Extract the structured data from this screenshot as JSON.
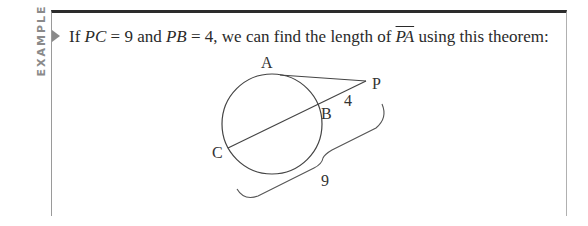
{
  "side_label": "EXAMPLE",
  "sentence": {
    "part1": "If ",
    "pc": "PC",
    "part2": " = 9 and ",
    "pb": "PB",
    "part3": " = 4, we can find the length of ",
    "pa": "PA",
    "part4": " using this theorem:"
  },
  "diagram": {
    "labels": {
      "A": "A",
      "B": "B",
      "C": "C",
      "P": "P",
      "pb_length": "4",
      "pc_length": "9"
    }
  }
}
